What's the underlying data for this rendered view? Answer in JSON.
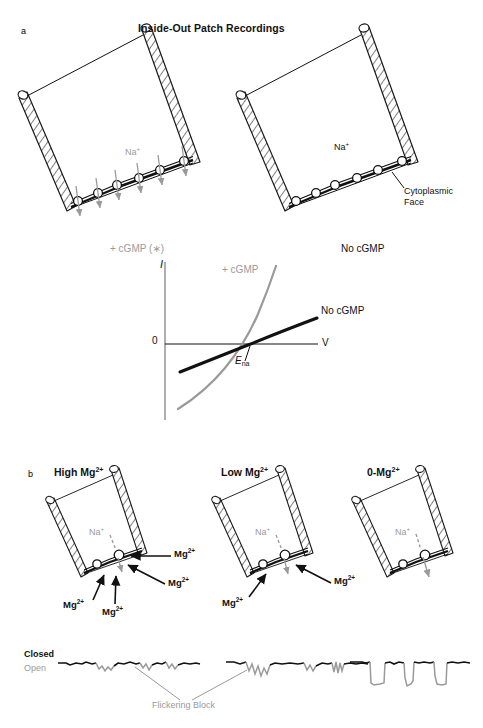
{
  "figure": {
    "panel_a": {
      "letter": "a",
      "title": "Inside-Out Patch Recordings",
      "left_diagram": {
        "condition_label": "+ cGMP (∗)",
        "ion_label": "Na",
        "ion_charge": "+",
        "channels_open": true,
        "flux_arrows": 6
      },
      "right_diagram": {
        "condition_label": "No cGMP",
        "ion_label": "Na",
        "ion_charge": "+",
        "annotation": "Cytoplasmic\nFace",
        "annotation_line1": "Cytoplasmic",
        "annotation_line2": "Face",
        "channels_open": false,
        "flux_arrows": 0
      }
    },
    "iv_plot": {
      "y_axis_label": "I",
      "x_axis_label": "V",
      "origin_label": "0",
      "reversal_label_main": "E",
      "reversal_label_sub": "na",
      "curve_cgmp_label": "+ cGMP",
      "curve_nocgmp_label": "No cGMP"
    },
    "panel_b": {
      "letter": "b",
      "diagrams": [
        {
          "condition_label": "High Mg",
          "condition_sup": "2+",
          "ion_label": "Na",
          "ion_charge": "+",
          "blockers": [
            "Mg",
            "Mg",
            "Mg",
            "Mg"
          ],
          "blocker_sup": "2+",
          "blocker_count": 4
        },
        {
          "condition_label": "Low Mg",
          "condition_sup": "2+",
          "ion_label": "Na",
          "ion_charge": "+",
          "blockers": [
            "Mg",
            "Mg"
          ],
          "blocker_sup": "2+",
          "blocker_count": 2
        },
        {
          "condition_label": "0-Mg",
          "condition_sup": "2+",
          "ion_label": "Na",
          "ion_charge": "+",
          "blockers": [],
          "blocker_sup": "2+",
          "blocker_count": 0
        }
      ],
      "traces": {
        "label_closed": "Closed",
        "label_open": "Open",
        "annotation": "Flickering Block",
        "segments": [
          {
            "name": "high-mg-trace",
            "style": "noisy-brief-flicker"
          },
          {
            "name": "low-mg-trace",
            "style": "noisy-long-flicker"
          },
          {
            "name": "zero-mg-trace",
            "style": "clean-square-openings"
          }
        ]
      }
    },
    "colors": {
      "ink": "#111111",
      "gray": "#9a9a9a",
      "hatch": "#1a1a1a",
      "white": "#ffffff"
    }
  }
}
